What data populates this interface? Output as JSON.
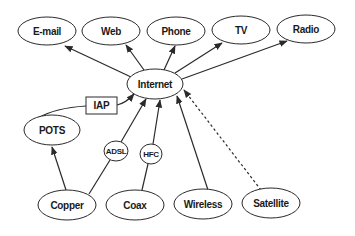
{
  "diagram": {
    "type": "directed-graph",
    "nodes": {
      "email": {
        "label": "E-mail",
        "shape": "ellipse"
      },
      "web": {
        "label": "Web",
        "shape": "ellipse"
      },
      "phone": {
        "label": "Phone",
        "shape": "ellipse"
      },
      "tv": {
        "label": "TV",
        "shape": "ellipse"
      },
      "radio": {
        "label": "Radio",
        "shape": "ellipse"
      },
      "internet": {
        "label": "Internet",
        "shape": "ellipse"
      },
      "iap": {
        "label": "IAP",
        "shape": "rectangle"
      },
      "pots": {
        "label": "POTS",
        "shape": "ellipse"
      },
      "adsl": {
        "label": "ADSL",
        "shape": "small-ellipse"
      },
      "hfc": {
        "label": "HFC",
        "shape": "small-ellipse"
      },
      "copper": {
        "label": "Copper",
        "shape": "ellipse"
      },
      "coax": {
        "label": "Coax",
        "shape": "ellipse"
      },
      "wireless": {
        "label": "Wireless",
        "shape": "ellipse"
      },
      "satellite": {
        "label": "Satellite",
        "shape": "ellipse"
      }
    },
    "edges": [
      {
        "from": "Internet",
        "to": "E-mail",
        "style": "solid",
        "arrow": true
      },
      {
        "from": "Internet",
        "to": "Web",
        "style": "solid",
        "arrow": true
      },
      {
        "from": "Internet",
        "to": "Phone",
        "style": "solid",
        "arrow": true
      },
      {
        "from": "Internet",
        "to": "TV",
        "style": "solid",
        "arrow": true
      },
      {
        "from": "Internet",
        "to": "Radio",
        "style": "solid",
        "arrow": true
      },
      {
        "from": "POTS",
        "to": "IAP",
        "style": "solid",
        "arrow": false
      },
      {
        "from": "IAP",
        "to": "Internet",
        "style": "solid",
        "arrow": true
      },
      {
        "from": "Copper",
        "to": "POTS",
        "style": "solid",
        "arrow": true
      },
      {
        "from": "Copper",
        "to": "Internet",
        "via": "ADSL",
        "style": "solid",
        "arrow": true
      },
      {
        "from": "Coax",
        "to": "Internet",
        "via": "HFC",
        "style": "solid",
        "arrow": true
      },
      {
        "from": "Wireless",
        "to": "Internet",
        "style": "solid",
        "arrow": true
      },
      {
        "from": "Satellite",
        "to": "Internet",
        "style": "dashed",
        "arrow": true
      }
    ],
    "colors": {
      "stroke": "#2a2a2a",
      "fill": "#ffffff",
      "background": "#ffffff"
    }
  }
}
